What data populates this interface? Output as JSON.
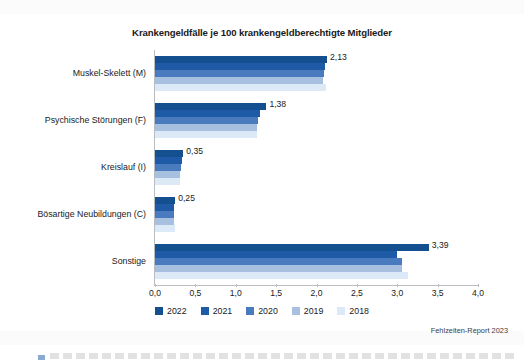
{
  "chart_data": {
    "type": "bar",
    "orientation": "horizontal",
    "title": "Krankengeldfälle je 100 krankengeldberechtigte Mitglieder",
    "xlabel": "",
    "ylabel": "",
    "xlim": [
      0,
      4
    ],
    "xticks": [
      "0,0",
      "0,5",
      "1,0",
      "1,5",
      "2,0",
      "2,5",
      "3,0",
      "3,5",
      "4,0"
    ],
    "xtick_values": [
      0,
      0.5,
      1.0,
      1.5,
      2.0,
      2.5,
      3.0,
      3.5,
      4.0
    ],
    "grid": false,
    "legend_position": "bottom",
    "categories": [
      "Muskel-Skelett (M)",
      "Psychische Störungen (F)",
      "Kreislauf (I)",
      "Bösartige Neubildungen (C)",
      "Sonstige"
    ],
    "series": [
      {
        "name": "2022",
        "color": "#14508f",
        "values": [
          2.13,
          1.38,
          0.35,
          0.25,
          3.39
        ],
        "labels": [
          "2,13",
          "1,38",
          "0,35",
          "0,25",
          "3,39"
        ]
      },
      {
        "name": "2021",
        "color": "#1f5aa6",
        "values": [
          2.11,
          1.3,
          0.33,
          0.24,
          3.0
        ],
        "labels": [
          "",
          "",
          "",
          "",
          ""
        ]
      },
      {
        "name": "2020",
        "color": "#4a7bbe",
        "values": [
          2.09,
          1.27,
          0.32,
          0.24,
          3.06
        ],
        "labels": [
          "",
          "",
          "",
          "",
          ""
        ]
      },
      {
        "name": "2019",
        "color": "#a8c0e0",
        "values": [
          2.08,
          1.26,
          0.31,
          0.23,
          3.06
        ],
        "labels": [
          "",
          "",
          "",
          "",
          ""
        ]
      },
      {
        "name": "2018",
        "color": "#dceaf7",
        "values": [
          2.12,
          1.26,
          0.31,
          0.25,
          3.13
        ],
        "labels": [
          "",
          "",
          "",
          "",
          ""
        ]
      }
    ],
    "value_labels_series": "2022",
    "source_note": "Fehlzeiten-Report 2023"
  },
  "legend": {
    "items": [
      {
        "label": "2022",
        "color": "#14508f"
      },
      {
        "label": "2021",
        "color": "#1f5aa6"
      },
      {
        "label": "2020",
        "color": "#4a7bbe"
      },
      {
        "label": "2019",
        "color": "#a8c0e0"
      },
      {
        "label": "2018",
        "color": "#dceaf7"
      }
    ]
  },
  "colors": {
    "axis": "#b9bcc0",
    "text": "#1a1a1a",
    "background": "#ffffff",
    "accent": "#14508f"
  }
}
